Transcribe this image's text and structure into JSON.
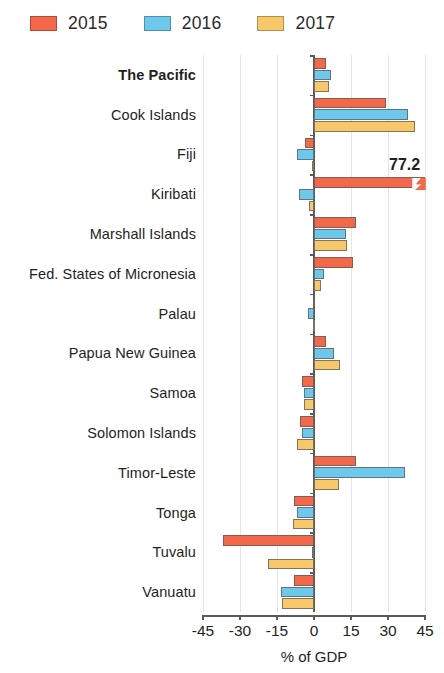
{
  "chart_data": {
    "type": "bar",
    "orientation": "horizontal",
    "title": "",
    "xlabel": "% of GDP",
    "ylabel": "",
    "xlim": [
      -45,
      45
    ],
    "xticks": [
      -45,
      -30,
      -15,
      0,
      15,
      30,
      45
    ],
    "xtick_labels": [
      "-45",
      "-30",
      "-15",
      "0",
      "15",
      "30",
      "45"
    ],
    "grid": true,
    "grid_axis": "x",
    "legend_position": "top-left",
    "categories": [
      "The Pacific",
      "Cook Islands",
      "Fiji",
      "Kiribati",
      "Marshall Islands",
      "Fed. States of Micronesia",
      "Palau",
      "Papua New Guinea",
      "Samoa",
      "Solomon Islands",
      "Timor-Leste",
      "Tonga",
      "Tuvalu",
      "Vanuatu"
    ],
    "bold_categories": [
      "The Pacific"
    ],
    "series": [
      {
        "name": "2015",
        "color": "#F4684A",
        "values": [
          5.0,
          29.0,
          -3.5,
          77.2,
          17.0,
          16.0,
          -0.5,
          5.0,
          -5.0,
          -5.5,
          17.0,
          -8.0,
          -37.0,
          -8.0
        ]
      },
      {
        "name": "2016",
        "color": "#6DC8EC",
        "values": [
          7.0,
          38.0,
          -7.0,
          -6.0,
          13.0,
          4.0,
          -2.5,
          8.0,
          -4.0,
          -5.0,
          37.0,
          -7.0,
          -1.0,
          -13.5
        ]
      },
      {
        "name": "2017",
        "color": "#F8C76A",
        "values": [
          6.0,
          41.0,
          -1.0,
          -2.0,
          13.5,
          3.0,
          -0.5,
          10.5,
          -4.0,
          -7.0,
          10.0,
          -8.5,
          -18.5,
          -13.0
        ]
      }
    ],
    "annotations": [
      {
        "label": "77.2",
        "category": "Kiribati",
        "series": "2015",
        "note": "bar truncated with axis-break zigzag at plot edge"
      }
    ]
  },
  "legend": {
    "items": [
      {
        "label": "2015",
        "color": "#F4684A",
        "swatch_name": "legend-swatch-2015"
      },
      {
        "label": "2016",
        "color": "#6DC8EC",
        "swatch_name": "legend-swatch-2016"
      },
      {
        "label": "2017",
        "color": "#F8C76A",
        "swatch_name": "legend-swatch-2017"
      }
    ]
  },
  "axis": {
    "title": "% of GDP"
  }
}
